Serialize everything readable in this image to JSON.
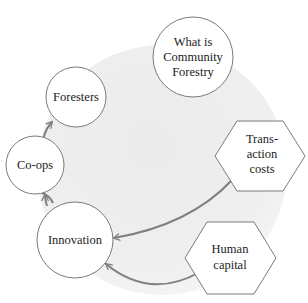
{
  "diagram": {
    "type": "concept-cycle",
    "colors": {
      "background_disc": "#efefef",
      "node_fill": "#ffffff",
      "node_stroke": "#7a7a7a",
      "arrow": "#7f7f7f",
      "text": "#1c1c1c"
    },
    "nodes": [
      {
        "id": "foresters",
        "shape": "circle",
        "lines": [
          "Foresters"
        ]
      },
      {
        "id": "community-forestry",
        "shape": "circle",
        "lines": [
          "What is",
          "Community",
          "Forestry"
        ]
      },
      {
        "id": "co-ops",
        "shape": "circle",
        "lines": [
          "Co-ops"
        ]
      },
      {
        "id": "innovation",
        "shape": "circle",
        "lines": [
          "Innovation"
        ]
      },
      {
        "id": "transaction-costs",
        "shape": "hexagon",
        "lines": [
          "Trans-",
          "action",
          "costs"
        ]
      },
      {
        "id": "human-capital",
        "shape": "hexagon",
        "lines": [
          "Human",
          "capital"
        ]
      }
    ],
    "edges": [
      {
        "from": "innovation",
        "to": "co-ops"
      },
      {
        "from": "co-ops",
        "to": "foresters"
      },
      {
        "from": "transaction-costs",
        "to": "innovation"
      },
      {
        "from": "human-capital",
        "to": "innovation"
      }
    ]
  }
}
